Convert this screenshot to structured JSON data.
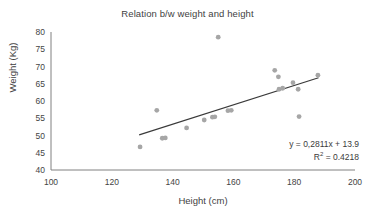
{
  "chart_data": {
    "type": "scatter",
    "title": "Relation b/w weight and height",
    "xlabel": "Height (cm)",
    "ylabel": "Weight (Kg)",
    "xlim": [
      100,
      200
    ],
    "ylim": [
      40,
      80
    ],
    "xticks": [
      100,
      120,
      140,
      160,
      180,
      200
    ],
    "yticks": [
      40,
      45,
      50,
      55,
      60,
      65,
      70,
      75,
      80
    ],
    "grid": false,
    "legend": "none",
    "marker_color": "#a6a6a6",
    "trendline_color": "#3a3a3a",
    "axis_color": "#808080",
    "points": [
      {
        "x": 129.3,
        "y": 46.7
      },
      {
        "x": 134.8,
        "y": 57.3
      },
      {
        "x": 136.6,
        "y": 49.2
      },
      {
        "x": 137.6,
        "y": 49.3
      },
      {
        "x": 144.6,
        "y": 52.2
      },
      {
        "x": 150.4,
        "y": 54.5
      },
      {
        "x": 153.1,
        "y": 55.3
      },
      {
        "x": 153.9,
        "y": 55.4
      },
      {
        "x": 155.0,
        "y": 78.5
      },
      {
        "x": 158.2,
        "y": 57.2
      },
      {
        "x": 159.3,
        "y": 57.3
      },
      {
        "x": 173.6,
        "y": 68.9
      },
      {
        "x": 174.8,
        "y": 67.0
      },
      {
        "x": 175.0,
        "y": 63.4
      },
      {
        "x": 176.2,
        "y": 63.7
      },
      {
        "x": 179.6,
        "y": 65.3
      },
      {
        "x": 181.3,
        "y": 63.4
      },
      {
        "x": 181.6,
        "y": 55.5
      },
      {
        "x": 187.8,
        "y": 67.5
      }
    ],
    "trendline": {
      "equation": "y = 0,2811x + 13.9",
      "r_squared": "R² = 0.4218",
      "slope": 0.2811,
      "intercept": 13.9,
      "x_start": 129.0,
      "x_end": 188.0
    },
    "annotations": [
      "y = 0,2811x + 13.9",
      "R² = 0.4218"
    ]
  },
  "equation_text": {
    "line1": "y = 0,2811x + 13.9",
    "r2_prefix": "R",
    "r2_sup": "2",
    "r2_rest": " = 0.4218"
  }
}
